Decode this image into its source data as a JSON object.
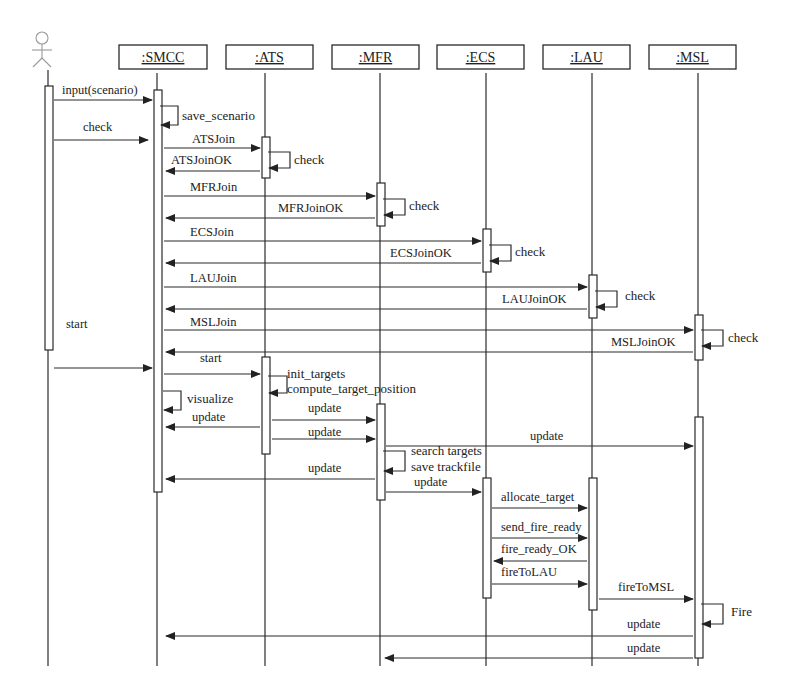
{
  "diagram": {
    "type": "uml-sequence-diagram",
    "actor": {
      "name": "user-actor",
      "x": 48,
      "head_y": 40
    },
    "objects": [
      {
        "id": "SMCC",
        "label": ":SMCC",
        "x": 157,
        "box_x": 119,
        "box_w": 88
      },
      {
        "id": "ATS",
        "label": ":ATS",
        "x": 265,
        "box_x": 226,
        "box_w": 87
      },
      {
        "id": "MFR",
        "label": ":MFR",
        "x": 380,
        "box_x": 332,
        "box_w": 87
      },
      {
        "id": "ECS",
        "label": ":ECS",
        "x": 486,
        "box_x": 437,
        "box_w": 87
      },
      {
        "id": "LAU",
        "label": ":LAU",
        "x": 592,
        "box_x": 543,
        "box_w": 87
      },
      {
        "id": "MSL",
        "label": ":MSL",
        "x": 698,
        "box_x": 649,
        "box_w": 87
      }
    ],
    "activations": [
      {
        "on": "actor",
        "x": 45,
        "y1": 86,
        "y2": 350
      },
      {
        "on": "SMCC",
        "x": 154,
        "y1": 90,
        "y2": 492
      },
      {
        "on": "ATS",
        "x": 262,
        "y1": 137,
        "y2": 178
      },
      {
        "on": "MFR",
        "x": 377,
        "y1": 183,
        "y2": 226
      },
      {
        "on": "ECS",
        "x": 483,
        "y1": 229,
        "y2": 272
      },
      {
        "on": "LAU",
        "x": 589,
        "y1": 275,
        "y2": 318
      },
      {
        "on": "MSL",
        "x": 695,
        "y1": 315,
        "y2": 360
      },
      {
        "on": "ATS",
        "x": 262,
        "y1": 357,
        "y2": 454
      },
      {
        "on": "MFR",
        "x": 377,
        "y1": 404,
        "y2": 500
      },
      {
        "on": "MSL",
        "x": 695,
        "y1": 417,
        "y2": 658
      },
      {
        "on": "ECS",
        "x": 483,
        "y1": 478,
        "y2": 598
      },
      {
        "on": "LAU",
        "x": 589,
        "y1": 478,
        "y2": 610
      }
    ],
    "messages": [
      {
        "label": "input(scenario)",
        "x1": 54,
        "x2": 152,
        "y": 100,
        "dir": "right",
        "lx": 62,
        "ly": 94
      },
      {
        "label": "check",
        "x1": 54,
        "x2": 148,
        "y": 140,
        "dir": "right",
        "lx": 83,
        "ly": 131
      },
      {
        "label": "ATSJoin",
        "x1": 164,
        "x2": 260,
        "y": 148,
        "dir": "right",
        "lx": 192,
        "ly": 143
      },
      {
        "label": "ATSJoinOK",
        "x1": 260,
        "x2": 166,
        "y": 171,
        "dir": "left",
        "lx": 171,
        "ly": 164
      },
      {
        "label": "MFRJoin",
        "x1": 164,
        "x2": 375,
        "y": 196,
        "dir": "right",
        "lx": 190,
        "ly": 191
      },
      {
        "label": "MFRJoinOK",
        "x1": 375,
        "x2": 166,
        "y": 218,
        "dir": "left",
        "lx": 278,
        "ly": 212
      },
      {
        "label": "ECSJoin",
        "x1": 164,
        "x2": 481,
        "y": 241,
        "dir": "right",
        "lx": 190,
        "ly": 236
      },
      {
        "label": "ECSJoinOK",
        "x1": 481,
        "x2": 166,
        "y": 263,
        "dir": "left",
        "lx": 390,
        "ly": 257
      },
      {
        "label": "LAUJoin",
        "x1": 164,
        "x2": 587,
        "y": 287,
        "dir": "right",
        "lx": 190,
        "ly": 282
      },
      {
        "label": "LAUJoinOK",
        "x1": 587,
        "x2": 166,
        "y": 309,
        "dir": "left",
        "lx": 502,
        "ly": 303
      },
      {
        "label": "MSLJoin",
        "x1": 164,
        "x2": 693,
        "y": 330,
        "dir": "right",
        "lx": 190,
        "ly": 326
      },
      {
        "label": "MSLJoinOK",
        "x1": 693,
        "x2": 166,
        "y": 352,
        "dir": "left",
        "lx": 611,
        "ly": 346
      },
      {
        "label": "start",
        "x1": 54,
        "x2": 152,
        "y": 368,
        "dir": "right",
        "lx": 66,
        "ly": 328
      },
      {
        "label": "start",
        "x1": 164,
        "x2": 260,
        "y": 374,
        "dir": "right",
        "lx": 200,
        "ly": 362
      },
      {
        "label": "update",
        "x1": 260,
        "x2": 166,
        "y": 427,
        "dir": "left",
        "lx": 192,
        "ly": 421
      },
      {
        "label": "update",
        "x1": 272,
        "x2": 375,
        "y": 420,
        "dir": "right",
        "lx": 308,
        "ly": 412
      },
      {
        "label": "update",
        "x1": 272,
        "x2": 375,
        "y": 439,
        "dir": "right",
        "lx": 308,
        "ly": 436
      },
      {
        "label": "update",
        "x1": 386,
        "x2": 693,
        "y": 446,
        "dir": "right",
        "lx": 530,
        "ly": 440
      },
      {
        "label": "update",
        "x1": 375,
        "x2": 166,
        "y": 479,
        "dir": "left",
        "lx": 308,
        "ly": 472
      },
      {
        "label": "update",
        "x1": 386,
        "x2": 481,
        "y": 492,
        "dir": "right",
        "lx": 414,
        "ly": 486
      },
      {
        "label": "allocate_target",
        "x1": 492,
        "x2": 587,
        "y": 508,
        "dir": "right",
        "lx": 501,
        "ly": 501
      },
      {
        "label": "send_fire_ready",
        "x1": 492,
        "x2": 587,
        "y": 538,
        "dir": "right",
        "lx": 501,
        "ly": 531
      },
      {
        "label": "fire_ready_OK",
        "x1": 587,
        "x2": 494,
        "y": 561,
        "dir": "left",
        "lx": 501,
        "ly": 553
      },
      {
        "label": "fireToLAU",
        "x1": 492,
        "x2": 587,
        "y": 584,
        "dir": "right",
        "lx": 501,
        "ly": 576
      },
      {
        "label": "fireToMSL",
        "x1": 599,
        "x2": 693,
        "y": 599,
        "dir": "right",
        "lx": 618,
        "ly": 591
      },
      {
        "label": "update",
        "x1": 693,
        "x2": 166,
        "y": 636,
        "dir": "left",
        "lx": 627,
        "ly": 628
      },
      {
        "label": "update",
        "x1": 693,
        "x2": 385,
        "y": 658,
        "dir": "left",
        "lx": 627,
        "ly": 652
      }
    ],
    "self_calls": [
      {
        "label": "save_scenario",
        "x": 160,
        "y1": 106,
        "y2": 125,
        "w": 18,
        "lx": 182,
        "ly": 120
      },
      {
        "label": "check",
        "x": 268,
        "y1": 152,
        "y2": 168,
        "w": 22,
        "lx": 294,
        "ly": 164
      },
      {
        "label": "check",
        "x": 383,
        "y1": 199,
        "y2": 215,
        "w": 22,
        "lx": 409,
        "ly": 210
      },
      {
        "label": "check",
        "x": 489,
        "y1": 245,
        "y2": 261,
        "w": 22,
        "lx": 515,
        "ly": 256
      },
      {
        "label": "check",
        "x": 595,
        "y1": 291,
        "y2": 307,
        "w": 22,
        "lx": 625,
        "ly": 300
      },
      {
        "label": "check",
        "x": 701,
        "y1": 330,
        "y2": 346,
        "w": 22,
        "lx": 728,
        "ly": 342
      },
      {
        "label": "init_targets",
        "x": 268,
        "y1": 376,
        "y2": 393,
        "w": 19,
        "lx": 287,
        "ly": 378
      },
      {
        "label": "compute_target_position",
        "x": 268,
        "y1": 376,
        "y2": 393,
        "w": 0,
        "lx": 287,
        "ly": 393
      },
      {
        "label": "visualize",
        "x": 163,
        "y1": 391,
        "y2": 410,
        "w": 18,
        "lx": 187,
        "ly": 403
      },
      {
        "label": "search targets",
        "x": 383,
        "y1": 451,
        "y2": 471,
        "w": 22,
        "lx": 411,
        "ly": 455
      },
      {
        "label": "save trackfile",
        "x": 383,
        "y1": 451,
        "y2": 471,
        "w": 0,
        "lx": 411,
        "ly": 471
      },
      {
        "label": "Fire",
        "x": 701,
        "y1": 604,
        "y2": 624,
        "w": 22,
        "lx": 731,
        "ly": 616
      }
    ],
    "lifeline_end_y": 666,
    "lifeline_start_y": 73
  }
}
